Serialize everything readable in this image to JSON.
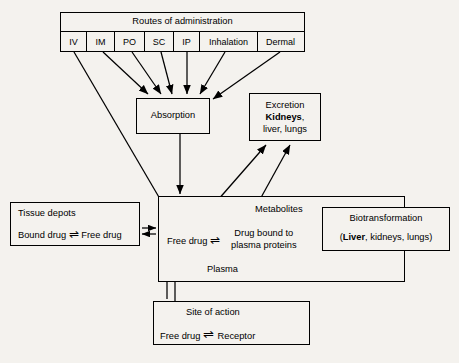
{
  "diagram": {
    "background_color": "#f4f2ee",
    "line_color": "#000000"
  },
  "routes": {
    "header": "Routes of administration",
    "cells": [
      {
        "label": "IV"
      },
      {
        "label": "IM"
      },
      {
        "label": "PO"
      },
      {
        "label": "SC"
      },
      {
        "label": "IP"
      },
      {
        "label": "Inhalation"
      },
      {
        "label": "Dermal"
      }
    ]
  },
  "absorption": {
    "label": "Absorption"
  },
  "excretion": {
    "line1": "Excretion",
    "line2_bold": "Kidneys",
    "line2_rest": ",",
    "line3": "liver, lungs"
  },
  "plasma": {
    "metabolites": "Metabolites",
    "free_drug": "Free drug",
    "equilibrium_symbol": "⇌",
    "bound_line1": "Drug bound to",
    "bound_line2": "plasma proteins",
    "compartment_label": "Plasma"
  },
  "tissue_depots": {
    "title": "Tissue depots",
    "bound_drug": "Bound drug",
    "equilibrium_symbol": "⇌",
    "free_drug": "Free drug"
  },
  "biotransformation": {
    "title": "Biotransformation",
    "sub_open": "(",
    "sub_bold": "Liver",
    "sub_rest": ", kidneys, lungs)"
  },
  "site_of_action": {
    "title": "Site of action",
    "free_drug": "Free drug",
    "equilibrium_symbol": "⇌",
    "receptor": "Receptor"
  }
}
